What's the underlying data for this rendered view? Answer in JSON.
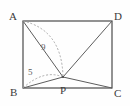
{
  "figure": {
    "shape": "rectangle",
    "vertex_labels": {
      "top_left": "A",
      "top_right": "D",
      "bottom_left": "B",
      "bottom_right": "C",
      "interior_point": "P"
    },
    "measure_labels": {
      "ap": "9",
      "bp": "5"
    },
    "colors": {
      "stroke": "#5d5d5d",
      "rect_stroke": "#4a4a4a",
      "dashed_stroke": "#9a9a9a",
      "label_text": "#3b3b3b",
      "measure_text": "#5a5a5a",
      "background": "#fefefe"
    },
    "geometry": {
      "A": [
        23,
        21
      ],
      "D": [
        112,
        21
      ],
      "B": [
        23,
        88
      ],
      "C": [
        112,
        88
      ],
      "P": [
        63,
        77
      ],
      "segments": [
        "A-P",
        "P-D",
        "P-C",
        "B-P"
      ],
      "dashed_arcs": [
        "A-P",
        "B-P"
      ]
    }
  }
}
